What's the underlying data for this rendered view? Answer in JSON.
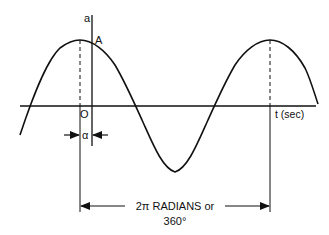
{
  "diagram": {
    "type": "sine-wave-phase-diagram",
    "labels": {
      "vertical_axis": "a",
      "point_a": "A",
      "origin": "O",
      "phase_angle": "α",
      "time_axis": "t (sec)",
      "period_line1": "2π RADIANS  or",
      "period_line2": "360°"
    },
    "colors": {
      "line": "#111111",
      "background": "#ffffff"
    }
  }
}
